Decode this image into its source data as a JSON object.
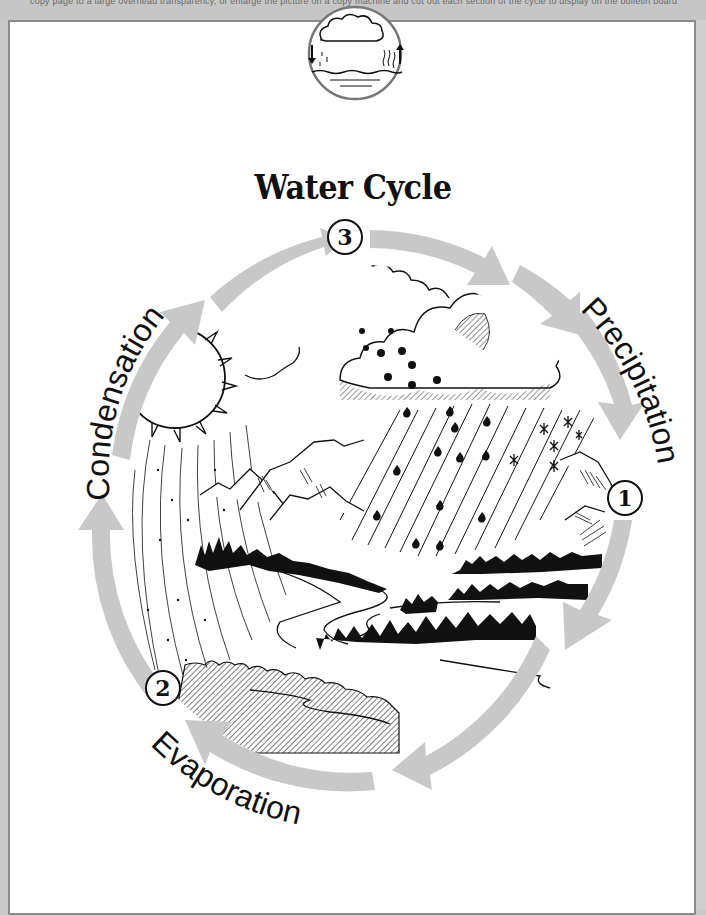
{
  "header": {
    "cut_off_text": "copy page to a large overhead transparency, or enlarge the picture on a copy machine and cut out each section of the cycle to display on the bulletin board"
  },
  "title": "Water Cycle",
  "icon": {
    "name": "water-cycle-mini-icon",
    "description": "cloud with rain down-arrow and rising vapor up-arrow over water"
  },
  "colors": {
    "arrow": "#c8c8c8",
    "ink": "#111111",
    "page": "#ffffff",
    "background": "#c9c9c9",
    "frame": "#8c8c8c"
  },
  "stages": [
    {
      "number": "1",
      "label": "Precipitation"
    },
    {
      "number": "2",
      "label": "Evaporation"
    },
    {
      "number": "3",
      "label": "Condensation"
    }
  ],
  "illustration": {
    "elements": [
      "sun",
      "clouds",
      "rain",
      "snowflakes",
      "mountains",
      "trees",
      "river",
      "lake shore",
      "vapor lines"
    ]
  }
}
